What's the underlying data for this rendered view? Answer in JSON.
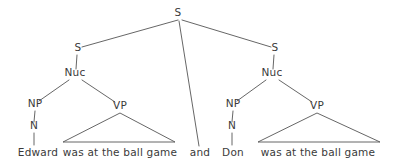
{
  "figure": {
    "type": "syntax-tree",
    "width": 400,
    "height": 168,
    "background_color": "#ffffff",
    "line_color": "#555555",
    "text_color": "#3a3a3a"
  },
  "nodes": {
    "root": {
      "label": "S",
      "x": 178,
      "y": 16
    },
    "left_s": {
      "label": "S",
      "x": 78,
      "y": 51
    },
    "left_nuc": {
      "label": "Nuc",
      "x": 75,
      "y": 76
    },
    "left_np": {
      "label": "NP",
      "x": 35,
      "y": 107
    },
    "left_n": {
      "label": "N",
      "x": 34,
      "y": 129
    },
    "left_vp": {
      "label": "VP",
      "x": 120,
      "y": 109
    },
    "right_s": {
      "label": "S",
      "x": 275,
      "y": 51
    },
    "right_nuc": {
      "label": "Nuc",
      "x": 272,
      "y": 76
    },
    "right_np": {
      "label": "NP",
      "x": 233,
      "y": 107
    },
    "right_n": {
      "label": "N",
      "x": 232,
      "y": 129
    },
    "right_vp": {
      "label": "VP",
      "x": 317,
      "y": 109
    }
  },
  "terminals": {
    "left_subject": {
      "label": "Edward",
      "x": 38,
      "y": 156
    },
    "left_predicate": {
      "label": "was at the ball game",
      "x": 120,
      "y": 156
    },
    "conjunction": {
      "label": "and",
      "x": 200,
      "y": 156
    },
    "right_subject": {
      "label": "Don",
      "x": 233,
      "y": 156
    },
    "right_predicate": {
      "label": "was at the ball game",
      "x": 318,
      "y": 156
    }
  },
  "edges": {
    "root_to_left_s": "M178,20 L82,47",
    "root_to_conjunction": "M179,21 L199,146",
    "root_to_right_s": "M182,20 L271,47",
    "left_s_to_nuc": "M77,55 L76,69",
    "left_nuc_to_np": "M69,80 L39,101",
    "left_nuc_to_vp": "M82,80 L115,102",
    "left_np_to_n": "M35,111 L34,122",
    "left_n_to_word": "M34,133 L34,145",
    "right_s_to_nuc": "M274,55 L273,69",
    "right_nuc_to_np": "M266,80 L237,101",
    "right_nuc_to_vp": "M279,80 L312,102",
    "right_np_to_n": "M233,111 L232,122",
    "right_n_to_word": "M232,133 L232,145"
  },
  "triangles": {
    "left_vp_triangle": "M120,113 L63,142 L175,142 Z",
    "right_vp_triangle": "M317,113 L258,142 L380,142 Z"
  }
}
